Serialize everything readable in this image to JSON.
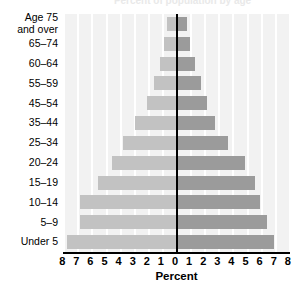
{
  "chart_data": {
    "type": "bar",
    "subtype": "population-pyramid",
    "title": "Percent of population by age",
    "xlabel": "Percent",
    "ylabel": "",
    "xlim": [
      -8,
      8
    ],
    "xticks": [
      "8",
      "7",
      "6",
      "5",
      "4",
      "3",
      "2",
      "1",
      "0",
      "1",
      "2",
      "3",
      "4",
      "5",
      "6",
      "7",
      "8"
    ],
    "xtick_values": [
      -8,
      -7,
      -6,
      -5,
      -4,
      -3,
      -2,
      -1,
      0,
      1,
      2,
      3,
      4,
      5,
      6,
      7,
      8
    ],
    "grid": "vertical",
    "legend": "none",
    "categories": [
      "Age 75\nand over",
      "65–74",
      "60–64",
      "55–59",
      "45–54",
      "35–44",
      "25–34",
      "20–24",
      "15–19",
      "10–14",
      "5–9",
      "Under 5"
    ],
    "series": [
      {
        "name": "left",
        "color": "#c2c2c2",
        "values": [
          0.7,
          0.9,
          1.2,
          1.6,
          2.1,
          3.0,
          3.8,
          4.6,
          5.6,
          6.9,
          6.9,
          7.8
        ]
      },
      {
        "name": "right",
        "color": "#9b9b9b",
        "values": [
          0.7,
          0.9,
          1.3,
          1.7,
          2.1,
          2.7,
          3.6,
          4.8,
          5.5,
          5.9,
          6.4,
          6.9
        ]
      }
    ]
  },
  "axis": {
    "percent_label": "Percent"
  },
  "colors": {
    "plot_background": "#f2f2f2",
    "gridline": "#ffffff",
    "axis": "#000000",
    "bar_left": "#c2c2c2",
    "bar_right": "#9b9b9b"
  }
}
